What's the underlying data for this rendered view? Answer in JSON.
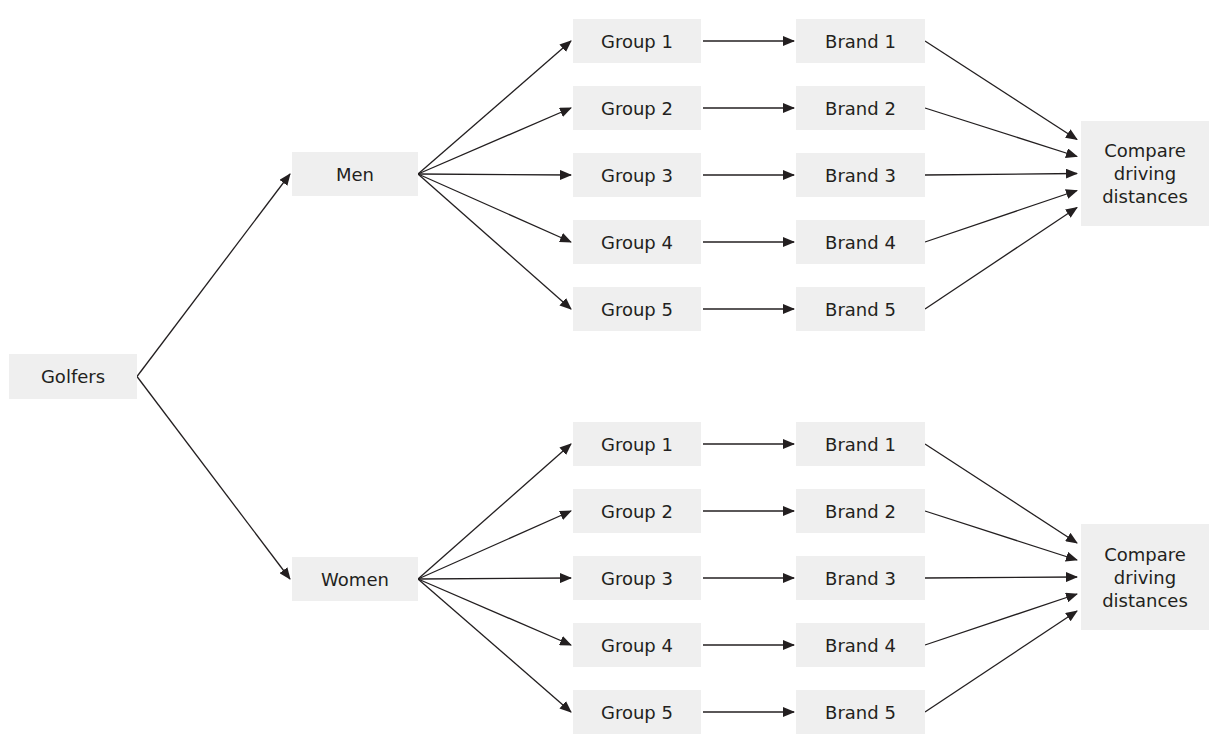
{
  "colors": {
    "box_fill": "#efefef",
    "text": "#231f20",
    "arrow": "#231f20",
    "background": "#ffffff"
  },
  "root": {
    "label": "Golfers",
    "x": 9,
    "y": 354,
    "w": 128,
    "h": 45
  },
  "branches": [
    {
      "id": "men",
      "label": "Men",
      "box": {
        "x": 292,
        "y": 152,
        "w": 126,
        "h": 44
      },
      "rows": [
        {
          "group": "Group 1",
          "brand": "Brand 1",
          "cy": 41
        },
        {
          "group": "Group 2",
          "brand": "Brand 2",
          "cy": 108
        },
        {
          "group": "Group 3",
          "brand": "Brand 3",
          "cy": 175
        },
        {
          "group": "Group 4",
          "brand": "Brand 4",
          "cy": 242
        },
        {
          "group": "Group 5",
          "brand": "Brand 5",
          "cy": 309
        }
      ],
      "compare": {
        "label": "Compare\ndriving\ndistances",
        "x": 1081,
        "y": 121,
        "w": 128,
        "h": 105
      }
    },
    {
      "id": "women",
      "label": "Women",
      "box": {
        "x": 292,
        "y": 557,
        "w": 126,
        "h": 44
      },
      "rows": [
        {
          "group": "Group 1",
          "brand": "Brand 1",
          "cy": 444
        },
        {
          "group": "Group 2",
          "brand": "Brand 2",
          "cy": 511
        },
        {
          "group": "Group 3",
          "brand": "Brand 3",
          "cy": 578
        },
        {
          "group": "Group 4",
          "brand": "Brand 4",
          "cy": 645
        },
        {
          "group": "Group 5",
          "brand": "Brand 5",
          "cy": 712
        }
      ],
      "compare": {
        "label": "Compare\ndriving\ndistances",
        "x": 1081,
        "y": 524,
        "w": 128,
        "h": 106
      }
    }
  ],
  "columns": {
    "group": {
      "x": 573,
      "w": 128,
      "h": 44
    },
    "brand": {
      "x": 796,
      "w": 129,
      "h": 44
    }
  }
}
